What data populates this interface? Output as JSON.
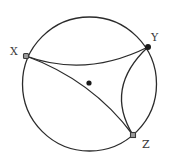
{
  "diagram": {
    "type": "hyperbolic-triangle-poincare-disk",
    "colors": {
      "stroke": "#2b2b2b",
      "vertex": "#3a3a3a",
      "center": "#1a1a1a",
      "background": "#ffffff"
    },
    "boundary_circle": {
      "cx": 89.5,
      "cy": 84,
      "r": 67
    },
    "center_point": {
      "x": 89,
      "y": 83
    },
    "vertices": [
      {
        "id": "X",
        "label": "X",
        "x": 26,
        "y": 56,
        "label_x": 10,
        "label_y": 55
      },
      {
        "id": "Y",
        "label": "Y",
        "x": 148,
        "y": 47,
        "label_x": 151,
        "label_y": 41
      },
      {
        "id": "Z",
        "label": "Z",
        "x": 133,
        "y": 135,
        "label_x": 142,
        "label_y": 148
      }
    ],
    "edges": [
      {
        "from": "X",
        "to": "Y",
        "path": "M26,56 Q86,78 148,47"
      },
      {
        "from": "X",
        "to": "Z",
        "path": "M26,56 Q92,80 133,135"
      },
      {
        "from": "Y",
        "to": "Z",
        "path": "M148,47 Q104,88 133,135"
      }
    ]
  }
}
